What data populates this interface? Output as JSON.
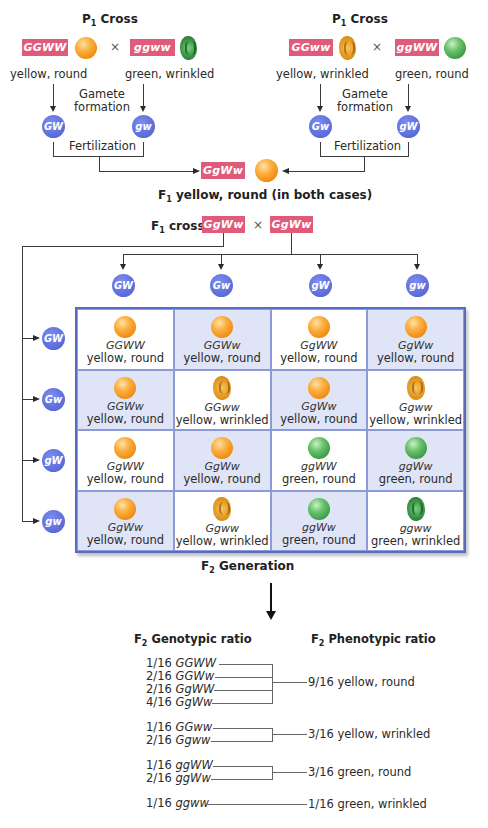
{
  "left_cross": {
    "title": "P",
    "title_sub": "1",
    "title_suffix": " Cross",
    "parent1": {
      "genotype": "GGWW",
      "phenotype": "yellow, round",
      "pea": "yellow-round-pea"
    },
    "parent2": {
      "genotype": "ggww",
      "phenotype": "green, wrinkled",
      "pea": "green-wrinkled-pea"
    },
    "times": "×",
    "gamete_label_1": "Gamete",
    "gamete_label_2": "formation",
    "gametes": [
      "GW",
      "gw"
    ],
    "fertilization": "Fertilization"
  },
  "right_cross": {
    "title": "P",
    "title_sub": "1",
    "title_suffix": " Cross",
    "parent1": {
      "genotype": "GGww",
      "phenotype": "yellow, wrinkled",
      "pea": "yellow-wrinkled-pea"
    },
    "parent2": {
      "genotype": "ggWW",
      "phenotype": "green, round",
      "pea": "green-round-pea"
    },
    "times": "×",
    "gamete_label_1": "Gamete",
    "gamete_label_2": "formation",
    "gametes": [
      "Gw",
      "gW"
    ],
    "fertilization": "Fertilization"
  },
  "f1": {
    "genotype": "GgWw",
    "title_prefix": "F",
    "title_sub": "1",
    "title_suffix": " yellow, round (in both cases)"
  },
  "f1_cross": {
    "label_prefix": "F",
    "label_sub": "1",
    "label_suffix": " cross",
    "parent1": "GgWw",
    "parent2": "GgWw",
    "times": "×"
  },
  "punnett": {
    "column_gametes": [
      "GW",
      "Gw",
      "gW",
      "gw"
    ],
    "row_gametes": [
      "GW",
      "Gw",
      "gW",
      "gw"
    ],
    "rows": [
      [
        {
          "genotype": "GGWW",
          "phenotype": "yellow, round",
          "pea": "yellow-round"
        },
        {
          "genotype": "GGWw",
          "phenotype": "yellow, round",
          "pea": "yellow-round"
        },
        {
          "genotype": "GgWW",
          "phenotype": "yellow, round",
          "pea": "yellow-round"
        },
        {
          "genotype": "GgWw",
          "phenotype": "yellow, round",
          "pea": "yellow-round"
        }
      ],
      [
        {
          "genotype": "GGWw",
          "phenotype": "yellow, round",
          "pea": "yellow-round"
        },
        {
          "genotype": "GGww",
          "phenotype": "yellow, wrinkled",
          "pea": "yellow-wrinkled"
        },
        {
          "genotype": "GgWw",
          "phenotype": "yellow, round",
          "pea": "yellow-round"
        },
        {
          "genotype": "Ggww",
          "phenotype": "yellow, wrinkled",
          "pea": "yellow-wrinkled"
        }
      ],
      [
        {
          "genotype": "GgWW",
          "phenotype": "yellow, round",
          "pea": "yellow-round"
        },
        {
          "genotype": "GgWw",
          "phenotype": "yellow, round",
          "pea": "yellow-round"
        },
        {
          "genotype": "ggWW",
          "phenotype": "green, round",
          "pea": "green-round"
        },
        {
          "genotype": "ggWw",
          "phenotype": "green, round",
          "pea": "green-round"
        }
      ],
      [
        {
          "genotype": "GgWw",
          "phenotype": "yellow, round",
          "pea": "yellow-round"
        },
        {
          "genotype": "Ggww",
          "phenotype": "yellow, wrinkled",
          "pea": "yellow-wrinkled"
        },
        {
          "genotype": "ggWw",
          "phenotype": "green, round",
          "pea": "green-round"
        },
        {
          "genotype": "ggww",
          "phenotype": "green, wrinkled",
          "pea": "green-wrinkled"
        }
      ]
    ]
  },
  "f2": {
    "title_prefix": "F",
    "title_sub": "2",
    "title_suffix": " Generation"
  },
  "ratios": {
    "genotypic_head_prefix": "F",
    "genotypic_head_sub": "2",
    "genotypic_head_suffix": " Genotypic ratio",
    "phenotypic_head_prefix": "F",
    "phenotypic_head_sub": "2",
    "phenotypic_head_suffix": " Phenotypic ratio",
    "groups": [
      {
        "genotypes": [
          {
            "fraction": "1/16",
            "genotype": "GGWW"
          },
          {
            "fraction": "2/16",
            "genotype": "GGWw"
          },
          {
            "fraction": "2/16",
            "genotype": "GgWW"
          },
          {
            "fraction": "4/16",
            "genotype": "GgWw"
          }
        ],
        "phenotype": "9/16 yellow, round"
      },
      {
        "genotypes": [
          {
            "fraction": "1/16",
            "genotype": "GGww"
          },
          {
            "fraction": "2/16",
            "genotype": "Ggww"
          }
        ],
        "phenotype": "3/16 yellow, wrinkled"
      },
      {
        "genotypes": [
          {
            "fraction": "1/16",
            "genotype": "ggWW"
          },
          {
            "fraction": "2/16",
            "genotype": "ggWw"
          }
        ],
        "phenotype": "3/16 green, round"
      },
      {
        "genotypes": [
          {
            "fraction": "1/16",
            "genotype": "ggww"
          }
        ],
        "phenotype": "1/16 green, wrinkled"
      }
    ]
  },
  "colors": {
    "genotype_box": "#e05a7a",
    "gamete_circle": "#5f6fdc",
    "grid_border": "#5a6cc0",
    "grid_shade": "#dfe4f6",
    "yellow_pea": "#f5a020",
    "green_pea": "#3a9a48"
  }
}
